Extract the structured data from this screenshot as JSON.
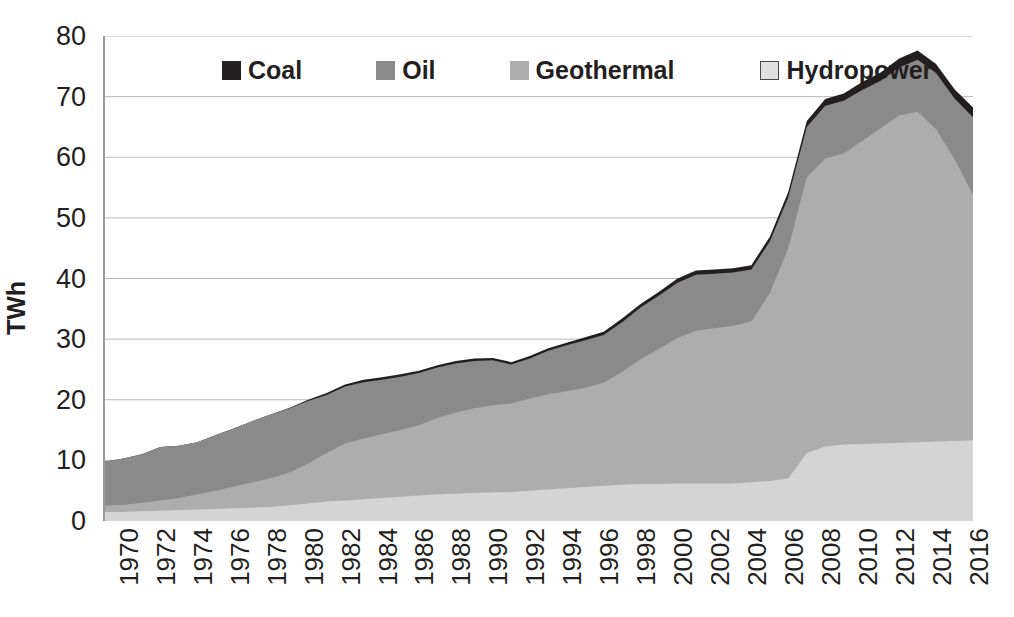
{
  "chart_data": {
    "type": "area",
    "stacked": true,
    "title": "",
    "subtitle": "",
    "xlabel": "",
    "ylabel": "TWh",
    "ylim": [
      0,
      80
    ],
    "yticks": [
      0,
      10,
      20,
      30,
      40,
      50,
      60,
      70,
      80
    ],
    "ytick_labels": [
      "0",
      "10",
      "20",
      "30",
      "40",
      "50",
      "60",
      "70",
      "80"
    ],
    "xlim": [
      1970,
      2017
    ],
    "grid": "horizontal",
    "legend_position": "top-center",
    "legend_entries": [
      "Coal",
      "Oil",
      "Geothermal",
      "Hydropower"
    ],
    "x": [
      1970,
      1971,
      1972,
      1973,
      1974,
      1975,
      1976,
      1977,
      1978,
      1979,
      1980,
      1981,
      1982,
      1983,
      1984,
      1985,
      1986,
      1987,
      1988,
      1989,
      1990,
      1991,
      1992,
      1993,
      1994,
      1995,
      1996,
      1997,
      1998,
      1999,
      2000,
      2001,
      2002,
      2003,
      2004,
      2005,
      2006,
      2007,
      2008,
      2009,
      2010,
      2011,
      2012,
      2013,
      2014,
      2015,
      2016,
      2017
    ],
    "xticks": [
      1970,
      1972,
      1974,
      1976,
      1978,
      1980,
      1982,
      1984,
      1986,
      1988,
      1990,
      1992,
      1994,
      1996,
      1998,
      2000,
      2002,
      2004,
      2006,
      2008,
      2010,
      2012,
      2014,
      2016
    ],
    "xtick_labels": [
      "1970",
      "1972",
      "1974",
      "1976",
      "1978",
      "1980",
      "1982",
      "1984",
      "1986",
      "1988",
      "1990",
      "1992",
      "1994",
      "1996",
      "1998",
      "2000",
      "2002",
      "2004",
      "2006",
      "2008",
      "2010",
      "2012",
      "2014",
      "2016"
    ],
    "stack_order_bottom_to_top": [
      "Hydropower",
      "Geothermal",
      "Oil",
      "Coal"
    ],
    "series": [
      {
        "name": "Coal",
        "color": "#231f20",
        "values": [
          0.0,
          0.0,
          0.0,
          0.0,
          0.0,
          0.0,
          0.0,
          0.0,
          0.0,
          0.0,
          0.1,
          0.2,
          0.3,
          0.3,
          0.4,
          0.4,
          0.4,
          0.4,
          0.4,
          0.4,
          0.4,
          0.4,
          0.4,
          0.4,
          0.4,
          0.4,
          0.5,
          0.5,
          0.6,
          0.6,
          0.6,
          0.7,
          0.7,
          0.7,
          0.7,
          0.7,
          0.8,
          0.9,
          1.0,
          1.1,
          1.2,
          1.3,
          1.4,
          1.5,
          1.5,
          1.5,
          1.5,
          1.6
        ]
      },
      {
        "name": "Oil",
        "color": "#8a8a8a",
        "values": [
          7.3,
          7.6,
          8.0,
          8.8,
          8.6,
          8.6,
          9.2,
          9.6,
          10.1,
          10.5,
          10.6,
          10.3,
          9.6,
          9.4,
          9.3,
          9.0,
          8.8,
          8.6,
          8.3,
          8.1,
          7.8,
          7.4,
          6.4,
          6.6,
          7.2,
          7.6,
          7.8,
          7.9,
          8.2,
          8.5,
          8.8,
          9.1,
          9.2,
          9.0,
          8.8,
          8.6,
          8.5,
          8.4,
          8.3,
          8.7,
          8.7,
          8.4,
          7.8,
          7.9,
          8.6,
          9.3,
          10.0,
          12.8
        ]
      },
      {
        "name": "Geothermal",
        "color": "#adadad",
        "values": [
          1.0,
          1.2,
          1.4,
          1.7,
          2.0,
          2.5,
          3.0,
          3.6,
          4.2,
          4.8,
          5.4,
          6.6,
          8.0,
          9.4,
          10.0,
          10.5,
          11.0,
          11.6,
          12.6,
          13.4,
          14.0,
          14.4,
          14.6,
          15.2,
          15.7,
          16.0,
          16.4,
          17.0,
          18.6,
          20.6,
          22.3,
          24.0,
          25.2,
          25.6,
          26.0,
          26.5,
          31.0,
          38.0,
          45.5,
          47.5,
          48.0,
          50.0,
          52.0,
          54.0,
          54.5,
          51.5,
          46.5,
          40.5
        ]
      },
      {
        "name": "Hydropower",
        "color": "#d4d4d4",
        "values": [
          1.5,
          1.5,
          1.6,
          1.7,
          1.8,
          1.9,
          2.0,
          2.1,
          2.2,
          2.3,
          2.6,
          2.9,
          3.2,
          3.4,
          3.6,
          3.8,
          4.0,
          4.2,
          4.4,
          4.5,
          4.6,
          4.7,
          4.8,
          5.0,
          5.2,
          5.4,
          5.6,
          5.8,
          6.0,
          6.1,
          6.1,
          6.2,
          6.2,
          6.2,
          6.2,
          6.4,
          6.6,
          7.0,
          11.2,
          12.3,
          12.6,
          12.7,
          12.8,
          12.9,
          13.0,
          13.1,
          13.2,
          13.3
        ]
      }
    ],
    "totals": [
      9.8,
      10.3,
      11.0,
      12.2,
      12.4,
      13.0,
      14.2,
      15.3,
      16.5,
      17.6,
      18.7,
      20.0,
      21.1,
      22.5,
      23.3,
      23.7,
      24.2,
      24.8,
      25.7,
      26.4,
      26.8,
      26.9,
      26.2,
      27.2,
      28.5,
      29.4,
      30.3,
      31.2,
      33.4,
      35.8,
      37.8,
      40.0,
      41.3,
      41.5,
      41.7,
      42.2,
      46.9,
      54.3,
      66.0,
      69.6,
      70.5,
      72.4,
      74.0,
      76.3,
      77.6,
      75.4,
      71.2,
      68.2
    ]
  },
  "axis": {
    "y_title": "TWh"
  },
  "legend": {
    "items": [
      {
        "label": "Coal",
        "color": "#231f20",
        "swatch": "filled"
      },
      {
        "label": "Oil",
        "color": "#8a8a8a",
        "swatch": "filled"
      },
      {
        "label": "Geothermal",
        "color": "#adadad",
        "swatch": "filled"
      },
      {
        "label": "Hydropower",
        "color": "#e0e0e0",
        "swatch": "outlined"
      }
    ]
  }
}
